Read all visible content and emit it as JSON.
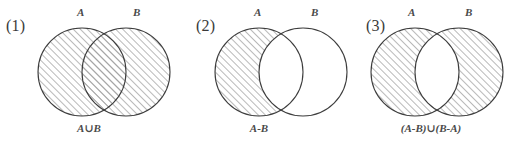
{
  "figure": {
    "background_color": "#ffffff",
    "stroke_color": "#3d3d3d",
    "hatch_color": "#9a9a9a",
    "text_color": "#4a4a4a",
    "panels": [
      {
        "number": "(1)",
        "label_a": "A",
        "label_b": "B",
        "caption": "A∪B",
        "operation": "union",
        "shaded_description": "both circles fully shaded"
      },
      {
        "number": "(2)",
        "label_a": "A",
        "label_b": "B",
        "caption": "A-B",
        "operation": "difference",
        "shaded_description": "part of A outside B shaded"
      },
      {
        "number": "(3)",
        "label_a": "A",
        "label_b": "B",
        "caption": "(A-B)∪(B-A)",
        "operation": "symmetric-difference",
        "shaded_description": "both circles shaded except the overlapping lens"
      }
    ]
  }
}
